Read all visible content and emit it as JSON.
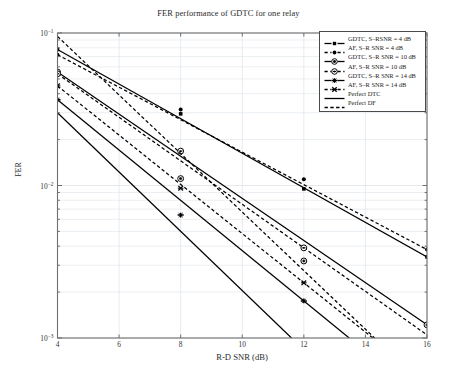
{
  "chart_data": {
    "type": "line",
    "title": "FER performance of GDTC for one relay",
    "xlabel": "R-D SNR (dB)",
    "ylabel": "FER",
    "xlim": [
      4,
      16
    ],
    "ylim": [
      0.001,
      0.1
    ],
    "yscale": "log",
    "grid": true,
    "legend_position": "top-right",
    "xticks": [
      4,
      6,
      8,
      10,
      12,
      14,
      16
    ],
    "xtick_labels": [
      "4",
      "6",
      "8",
      "10",
      "12",
      "14",
      "16"
    ],
    "ytick_labels": [
      "10-3",
      "10-2",
      "10-1"
    ],
    "ytick_values": [
      0.001,
      0.01,
      0.1
    ],
    "series": [
      {
        "name": "GDTC, S-RSNR = 4 dB",
        "linestyle": "solid",
        "marker": "filled-square",
        "color": "#000000",
        "x": [
          4,
          8,
          12,
          16
        ],
        "values": [
          0.078,
          0.0295,
          0.0095,
          0.0034
        ]
      },
      {
        "name": "AF, S-R SNR = 4 dB",
        "linestyle": "dashed",
        "marker": "filled-circle",
        "color": "#000000",
        "x": [
          4,
          8,
          12,
          16
        ],
        "values": [
          0.072,
          0.0315,
          0.011,
          0.0038
        ]
      },
      {
        "name": "GDTC, S-R SNR = 10 dB",
        "linestyle": "solid",
        "marker": "open-circle",
        "color": "#000000",
        "x": [
          4,
          8,
          12,
          16
        ],
        "values": [
          0.0555,
          0.0111,
          0.0032,
          0.00122
        ]
      },
      {
        "name": "AF, S-R SNR = 10 dB",
        "linestyle": "dashed",
        "marker": "circle-dot",
        "color": "#000000",
        "x": [
          4,
          8,
          12
        ],
        "values": [
          0.054,
          0.0168,
          0.0039
        ]
      },
      {
        "name": "GDTC, S-R SNR = 14 dB",
        "linestyle": "solid",
        "marker": "plus",
        "color": "#000000",
        "x": [
          4,
          8,
          12
        ],
        "values": [
          0.0365,
          0.0064,
          0.00175
        ]
      },
      {
        "name": "AF, S-R SNR = 14 dB",
        "linestyle": "dashed",
        "marker": "x-mark",
        "color": "#000000",
        "x": [
          4,
          8,
          12
        ],
        "values": [
          0.045,
          0.0096,
          0.0023
        ]
      },
      {
        "name": "Perfect DTC",
        "linestyle": "solid",
        "marker": "none",
        "color": "#000000",
        "x": [
          4,
          11.6
        ],
        "values": [
          0.03,
          0.001
        ]
      },
      {
        "name": "Perfect DF",
        "linestyle": "dashed",
        "marker": "none",
        "color": "#000000",
        "x": [
          4,
          14.3
        ],
        "values": [
          0.095,
          0.001
        ]
      }
    ]
  },
  "legend": {
    "items": [
      {
        "label": "GDTC, S–RSNR = 4 dB",
        "marker": "filled-square",
        "linestyle": "solid"
      },
      {
        "label": "AF, S–R SNR = 4 dB",
        "marker": "filled-circle",
        "linestyle": "dashed"
      },
      {
        "label": "GDTC, S–R SNR = 10 dB",
        "marker": "open-circle",
        "linestyle": "solid"
      },
      {
        "label": "AF, S–R SNR = 10 dB",
        "marker": "circle-dot",
        "linestyle": "dashed"
      },
      {
        "label": "GDTC, S–R SNR = 14 dB",
        "marker": "plus",
        "linestyle": "solid"
      },
      {
        "label": "AF, S–R SNR = 14 dB",
        "marker": "x-mark",
        "linestyle": "dashed"
      },
      {
        "label": "Perfect DTC",
        "marker": "none",
        "linestyle": "solid"
      },
      {
        "label": "Perfect DF",
        "marker": "none",
        "linestyle": "dashed"
      }
    ]
  },
  "axes": {
    "frame_color": "#6f6f6f",
    "grid_color": "#e2e6ec"
  }
}
